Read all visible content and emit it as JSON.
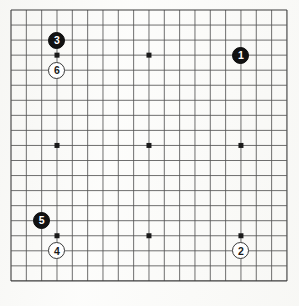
{
  "figure": {
    "board_type": "go-board",
    "size": 19,
    "background_color": "#fdfdfc",
    "line_color": "#555555",
    "border_color": "#3c3c3c"
  },
  "board": {
    "columns": 19,
    "rows": 19,
    "origin_x": 11,
    "origin_y": 10,
    "spacing_x": 15.33,
    "spacing_y": 15.05,
    "star_points": [
      {
        "col": 3,
        "row": 3
      },
      {
        "col": 9,
        "row": 3
      },
      {
        "col": 15,
        "row": 3
      },
      {
        "col": 3,
        "row": 9
      },
      {
        "col": 9,
        "row": 9
      },
      {
        "col": 15,
        "row": 9
      },
      {
        "col": 3,
        "row": 15
      },
      {
        "col": 9,
        "row": 15
      },
      {
        "col": 15,
        "row": 15
      }
    ],
    "star_point_size": 5
  },
  "stones": [
    {
      "label": "1",
      "color": "black",
      "col": 15,
      "row": 3,
      "name": "stone-1-black"
    },
    {
      "label": "2",
      "color": "white",
      "col": 15,
      "row": 16,
      "name": "stone-2-white"
    },
    {
      "label": "3",
      "color": "black",
      "col": 3,
      "row": 2,
      "name": "stone-3-black"
    },
    {
      "label": "4",
      "color": "white",
      "col": 3,
      "row": 16,
      "name": "stone-4-white"
    },
    {
      "label": "5",
      "color": "black",
      "col": 2,
      "row": 14,
      "name": "stone-5-black"
    },
    {
      "label": "6",
      "color": "white",
      "col": 3,
      "row": 4,
      "name": "stone-6-white"
    }
  ],
  "stone_style": {
    "diameter": 17,
    "font_size": 10.5
  }
}
